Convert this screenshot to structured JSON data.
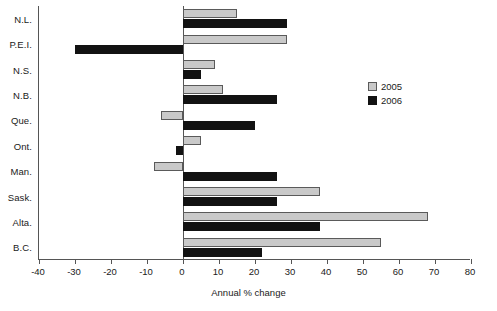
{
  "chart_data": {
    "type": "bar",
    "orientation": "horizontal",
    "title": "",
    "subtitle": "",
    "xlabel": "Annual % change",
    "ylabel": "",
    "xlim": [
      -40,
      80
    ],
    "xticks": [
      -40,
      -30,
      -20,
      -10,
      0,
      10,
      20,
      30,
      40,
      50,
      60,
      70,
      80
    ],
    "xtick_labels": [
      "-40",
      "-30",
      "-20",
      "-10",
      "0",
      "10",
      "20",
      "30",
      "40",
      "50",
      "60",
      "70",
      "80"
    ],
    "grid": false,
    "legend_position": "inside-right",
    "categories": [
      "N.L.",
      "P.E.I.",
      "N.S.",
      "N.B.",
      "Que.",
      "Ont.",
      "Man.",
      "Sask.",
      "Alta.",
      "B.C."
    ],
    "series": [
      {
        "name": "2005",
        "color": "#c9c9c9",
        "edge_color": "#5a5a5a",
        "values": [
          15,
          29,
          9,
          11,
          -6,
          5,
          -8,
          38,
          68,
          55
        ]
      },
      {
        "name": "2006",
        "color": "#121212",
        "edge_color": "#121212",
        "values": [
          29,
          -30,
          5,
          26,
          20,
          -2,
          26,
          26,
          38,
          22
        ]
      }
    ]
  },
  "legend": {
    "entries": [
      {
        "label": "2005",
        "swatch": "light-gray-square"
      },
      {
        "label": "2006",
        "swatch": "black-square"
      }
    ]
  },
  "axis": {
    "x_title": "Annual % change"
  }
}
